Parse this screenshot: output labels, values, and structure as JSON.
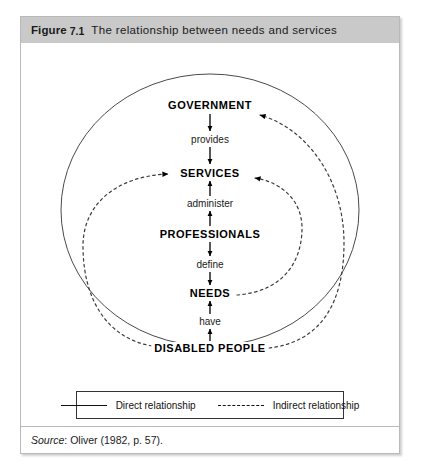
{
  "figure": {
    "label": "Figure",
    "number": "7.1",
    "title": "The relationship between needs and services"
  },
  "diagram": {
    "nodes": [
      {
        "id": "government",
        "label": "GOVERNMENT",
        "x": 189,
        "y": 62
      },
      {
        "id": "services",
        "label": "SERVICES",
        "x": 189,
        "y": 130
      },
      {
        "id": "professionals",
        "label": "PROFESSIONALS",
        "x": 189,
        "y": 191
      },
      {
        "id": "needs",
        "label": "NEEDS",
        "x": 189,
        "y": 250
      },
      {
        "id": "disabled-people",
        "label": "DISABLED PEOPLE",
        "x": 189,
        "y": 305
      }
    ],
    "verbs": [
      {
        "id": "provides",
        "label": "provides",
        "x": 189,
        "y": 96
      },
      {
        "id": "administer",
        "label": "administer",
        "x": 189,
        "y": 160
      },
      {
        "id": "define",
        "label": "define",
        "x": 189,
        "y": 221
      },
      {
        "id": "have",
        "label": "have",
        "x": 189,
        "y": 278
      }
    ],
    "colors": {
      "solid_line": "#3b3b3b",
      "dashed_line": "#3b3b3b",
      "arrow": "#000000",
      "header_background": "#c9c9c9",
      "border": "#b9b9b9"
    }
  },
  "legend": {
    "items": [
      {
        "id": "direct",
        "label": "Direct relationship",
        "style": "solid"
      },
      {
        "id": "indirect",
        "label": "Indirect relationship",
        "style": "dashed"
      }
    ]
  },
  "source": {
    "keyword": "Source",
    "separator": ":",
    "text": "Oliver (1982, p. 57)."
  }
}
